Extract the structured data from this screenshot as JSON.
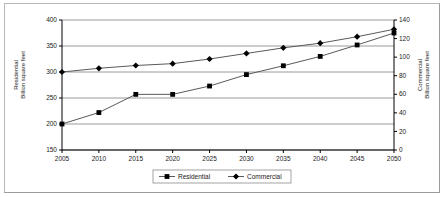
{
  "chart_data": {
    "type": "line",
    "title": "",
    "xlabel": "",
    "categories": [
      2005,
      2010,
      2015,
      2020,
      2025,
      2030,
      2035,
      2040,
      2045,
      2050
    ],
    "x_tick_labels": [
      "2005",
      "2010",
      "2015",
      "2020",
      "2025",
      "2030",
      "2035",
      "2040",
      "2045",
      "2050"
    ],
    "xlim": [
      2005,
      2050
    ],
    "grid": true,
    "legend_position": "bottom-center",
    "series": [
      {
        "name": "Residential",
        "axis": "left",
        "marker": "square",
        "color": "#000000",
        "values": [
          200,
          222,
          257,
          257,
          273,
          295,
          312,
          330,
          352,
          375
        ]
      },
      {
        "name": "Commercial",
        "axis": "right",
        "marker": "diamond",
        "color": "#000000",
        "values": [
          84,
          88,
          91,
          93,
          98,
          104,
          110,
          115,
          122,
          130
        ]
      }
    ],
    "left_axis": {
      "label_line1": "Residential",
      "label_line2": "Billion square feet",
      "ylim": [
        150,
        400
      ],
      "ticks": [
        150,
        200,
        250,
        300,
        350,
        400
      ],
      "tick_labels": [
        "150",
        "200",
        "250",
        "300",
        "350",
        "400"
      ]
    },
    "right_axis": {
      "label_line1": "Commercial",
      "label_line2": "Billion square feet",
      "ylim": [
        0,
        140
      ],
      "ticks": [
        0,
        20,
        40,
        60,
        80,
        100,
        120,
        140
      ],
      "tick_labels": [
        "0",
        "20",
        "40",
        "60",
        "80",
        "100",
        "120",
        "140"
      ]
    },
    "legend": [
      {
        "label": "Residential",
        "marker": "square"
      },
      {
        "label": "Commercial",
        "marker": "diamond"
      }
    ]
  },
  "style": {
    "gridline_color": "#808080",
    "axis_color": "#000000",
    "series_line_color": "#595959",
    "marker_color": "#000000",
    "frame_color": "#b8b8b8",
    "background": "#ffffff"
  }
}
